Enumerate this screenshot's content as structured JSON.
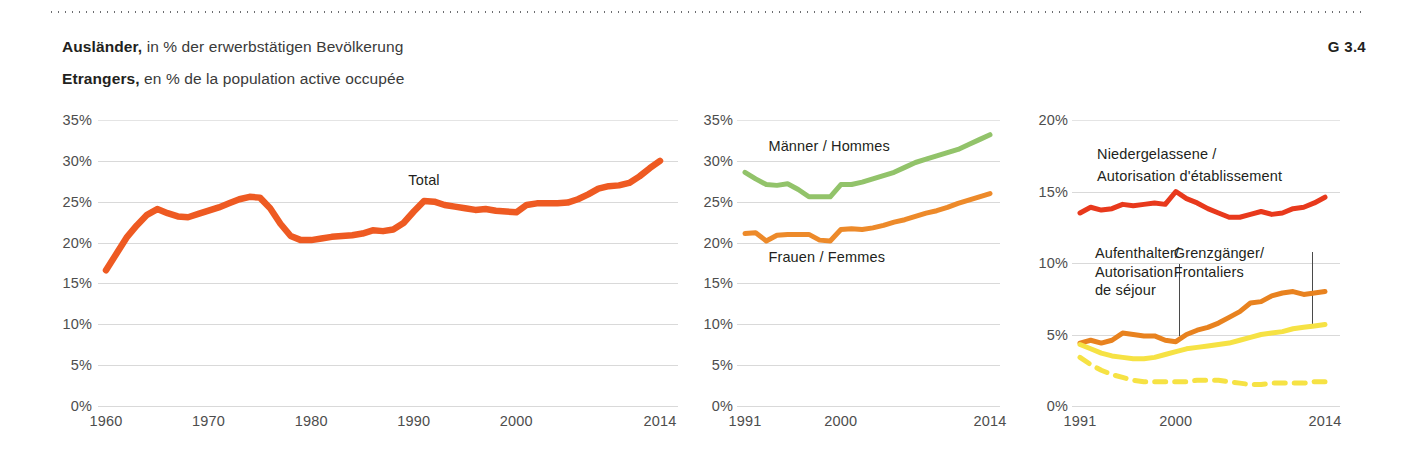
{
  "header": {
    "de_bold": "Ausländer,",
    "de_rest": " in % der erwerbstätigen Bevölkerung",
    "fr_bold": "Etrangers,",
    "fr_rest": " en % de la population active occupée",
    "figure_number": "G 3.4"
  },
  "colors": {
    "total_orange": "#EE5A22",
    "men_green": "#92C36A",
    "women_orange": "#ED8A2A",
    "settled_red": "#E8391C",
    "resident_orange": "#E8821F",
    "crossborder_yellow": "#F6E244",
    "other_yellow": "#F6E244",
    "grid": "#d9d9d9",
    "text": "#231f20"
  },
  "chart_data": [
    {
      "id": "total",
      "type": "line",
      "title": "",
      "xlabel": "",
      "ylabel": "",
      "xlim": [
        1960,
        2014
      ],
      "ylim": [
        0,
        35
      ],
      "grid": true,
      "ytick_labels": [
        "35%",
        "30%",
        "25%",
        "20%",
        "15%",
        "10%",
        "5%",
        "0%"
      ],
      "yticks": [
        35,
        30,
        25,
        20,
        15,
        10,
        5,
        0
      ],
      "xtick_labels": [
        "1960",
        "1970",
        "1980",
        "1990",
        "2000",
        "2014"
      ],
      "xticks": [
        1960,
        1970,
        1980,
        1990,
        2000,
        2014
      ],
      "annotations": [
        {
          "text": "Total",
          "x": 1991,
          "y": 27.6
        }
      ],
      "series": [
        {
          "name": "Total",
          "color": "#EE5A22",
          "dash": false,
          "x": [
            1960,
            1961,
            1962,
            1963,
            1964,
            1965,
            1966,
            1967,
            1968,
            1969,
            1970,
            1971,
            1972,
            1973,
            1974,
            1975,
            1976,
            1977,
            1978,
            1979,
            1980,
            1981,
            1982,
            1983,
            1984,
            1985,
            1986,
            1987,
            1988,
            1989,
            1990,
            1991,
            1992,
            1993,
            1994,
            1995,
            1996,
            1997,
            1998,
            1999,
            2000,
            2001,
            2002,
            2003,
            2004,
            2005,
            2006,
            2007,
            2008,
            2009,
            2010,
            2011,
            2012,
            2013,
            2014
          ],
          "values": [
            16.6,
            18.6,
            20.6,
            22.1,
            23.4,
            24.1,
            23.6,
            23.2,
            23.1,
            23.5,
            23.9,
            24.3,
            24.8,
            25.3,
            25.6,
            25.5,
            24.2,
            22.3,
            20.8,
            20.3,
            20.3,
            20.5,
            20.7,
            20.8,
            20.9,
            21.1,
            21.5,
            21.4,
            21.6,
            22.4,
            23.8,
            25.1,
            25.0,
            24.6,
            24.4,
            24.2,
            24.0,
            24.1,
            23.9,
            23.8,
            23.7,
            24.6,
            24.8,
            24.8,
            24.8,
            24.9,
            25.3,
            25.9,
            26.6,
            26.9,
            27.0,
            27.3,
            28.1,
            29.1,
            30.0
          ]
        }
      ]
    },
    {
      "id": "by-sex",
      "type": "line",
      "xlim": [
        1991,
        2014
      ],
      "ylim": [
        0,
        35
      ],
      "grid": true,
      "ytick_labels": [
        "35%",
        "30%",
        "25%",
        "20%",
        "15%",
        "10%",
        "5%",
        "0%"
      ],
      "yticks": [
        35,
        30,
        25,
        20,
        15,
        10,
        5,
        0
      ],
      "xtick_labels": [
        "1991",
        "2000",
        "2014"
      ],
      "xticks": [
        1991,
        2000,
        2014
      ],
      "annotations": [
        {
          "text": "Männer / Hommes",
          "x": 1993.2,
          "y": 31.8
        },
        {
          "text": "Frauen / Femmes",
          "x": 1993.2,
          "y": 18.2
        }
      ],
      "series": [
        {
          "name": "Männer / Hommes",
          "color": "#92C36A",
          "dash": false,
          "x": [
            1991,
            1992,
            1993,
            1994,
            1995,
            1996,
            1997,
            1998,
            1999,
            2000,
            2001,
            2002,
            2003,
            2004,
            2005,
            2006,
            2007,
            2008,
            2009,
            2010,
            2011,
            2012,
            2013,
            2014
          ],
          "values": [
            28.6,
            27.8,
            27.1,
            27.0,
            27.2,
            26.5,
            25.6,
            25.6,
            25.6,
            27.1,
            27.1,
            27.4,
            27.8,
            28.2,
            28.6,
            29.2,
            29.8,
            30.2,
            30.6,
            31.0,
            31.4,
            32.0,
            32.6,
            33.2
          ]
        },
        {
          "name": "Frauen / Femmes",
          "color": "#ED8A2A",
          "dash": false,
          "x": [
            1991,
            1992,
            1993,
            1994,
            1995,
            1996,
            1997,
            1998,
            1999,
            2000,
            2001,
            2002,
            2003,
            2004,
            2005,
            2006,
            2007,
            2008,
            2009,
            2010,
            2011,
            2012,
            2013,
            2014
          ],
          "values": [
            21.1,
            21.2,
            20.2,
            20.9,
            21.0,
            21.0,
            21.0,
            20.3,
            20.2,
            21.6,
            21.7,
            21.6,
            21.8,
            22.1,
            22.5,
            22.8,
            23.2,
            23.6,
            23.9,
            24.3,
            24.8,
            25.2,
            25.6,
            26.0
          ]
        }
      ]
    },
    {
      "id": "by-permit",
      "type": "line",
      "xlim": [
        1991,
        2014
      ],
      "ylim": [
        0,
        20
      ],
      "grid": true,
      "ytick_labels": [
        "20%",
        "15%",
        "10%",
        "5%",
        "0%"
      ],
      "yticks": [
        20,
        15,
        10,
        5,
        0
      ],
      "xtick_labels": [
        "1991",
        "2000",
        "2014"
      ],
      "xticks": [
        1991,
        2000,
        2014
      ],
      "annotations": [
        {
          "text": "Niedergelassene /",
          "x": 1992.6,
          "y": 17.6
        },
        {
          "text": "Autorisation d'établissement",
          "x": 1992.6,
          "y": 16.1
        },
        {
          "text": "Aufenthalter/",
          "x": 1992.4,
          "y": 10.7
        },
        {
          "text": "Autorisation",
          "x": 1992.4,
          "y": 9.4
        },
        {
          "text": "de séjour",
          "x": 1992.4,
          "y": 8.1
        },
        {
          "text": "Grenzgänger/",
          "x": 1999.8,
          "y": 10.7
        },
        {
          "text": "Frontaliers",
          "x": 1999.8,
          "y": 9.4
        }
      ],
      "leaders": [
        {
          "x": 2000.3,
          "y_top": 9.9,
          "y_bottom": 4.9
        },
        {
          "x": 2012.8,
          "y_top": 10.8,
          "y_bottom": 5.5
        }
      ],
      "series": [
        {
          "name": "Niedergelassene / Autorisation d'établissement",
          "color": "#E8391C",
          "dash": false,
          "x": [
            1991,
            1992,
            1993,
            1994,
            1995,
            1996,
            1997,
            1998,
            1999,
            2000,
            2001,
            2002,
            2003,
            2004,
            2005,
            2006,
            2007,
            2008,
            2009,
            2010,
            2011,
            2012,
            2013,
            2014
          ],
          "values": [
            13.5,
            13.9,
            13.7,
            13.8,
            14.1,
            14.0,
            14.1,
            14.2,
            14.1,
            15.0,
            14.5,
            14.2,
            13.8,
            13.5,
            13.2,
            13.2,
            13.4,
            13.6,
            13.4,
            13.5,
            13.8,
            13.9,
            14.2,
            14.6
          ]
        },
        {
          "name": "Aufenthalter / Autorisation de séjour",
          "color": "#E8821F",
          "dash": false,
          "x": [
            1991,
            1992,
            1993,
            1994,
            1995,
            1996,
            1997,
            1998,
            1999,
            2000,
            2001,
            2002,
            2003,
            2004,
            2005,
            2006,
            2007,
            2008,
            2009,
            2010,
            2011,
            2012,
            2013,
            2014
          ],
          "values": [
            4.4,
            4.6,
            4.4,
            4.6,
            5.1,
            5.0,
            4.9,
            4.9,
            4.6,
            4.5,
            5.0,
            5.3,
            5.5,
            5.8,
            6.2,
            6.6,
            7.2,
            7.3,
            7.7,
            7.9,
            8.0,
            7.8,
            7.9,
            8.0
          ]
        },
        {
          "name": "Grenzgänger / Frontaliers",
          "color": "#F6E244",
          "dash": false,
          "x": [
            1991,
            1992,
            1993,
            1994,
            1995,
            1996,
            1997,
            1998,
            1999,
            2000,
            2001,
            2002,
            2003,
            2004,
            2005,
            2006,
            2007,
            2008,
            2009,
            2010,
            2011,
            2012,
            2013,
            2014
          ],
          "values": [
            4.3,
            4.0,
            3.7,
            3.5,
            3.4,
            3.3,
            3.3,
            3.4,
            3.6,
            3.8,
            4.0,
            4.1,
            4.2,
            4.3,
            4.4,
            4.6,
            4.8,
            5.0,
            5.1,
            5.2,
            5.4,
            5.5,
            5.6,
            5.7
          ]
        },
        {
          "name": "Übrige / Autres",
          "color": "#F6E244",
          "dash": true,
          "x": [
            1991,
            1992,
            1993,
            1994,
            1995,
            1996,
            1997,
            1998,
            1999,
            2000,
            2001,
            2002,
            2003,
            2004,
            2005,
            2006,
            2007,
            2008,
            2009,
            2010,
            2011,
            2012,
            2013,
            2014
          ],
          "values": [
            3.4,
            2.9,
            2.5,
            2.2,
            2.0,
            1.8,
            1.7,
            1.7,
            1.7,
            1.7,
            1.7,
            1.8,
            1.8,
            1.8,
            1.7,
            1.6,
            1.5,
            1.5,
            1.6,
            1.6,
            1.6,
            1.6,
            1.7,
            1.7
          ]
        }
      ]
    }
  ]
}
